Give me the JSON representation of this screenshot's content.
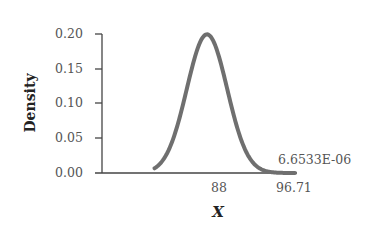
{
  "chart_data": {
    "type": "line",
    "title": "",
    "xlabel": "X",
    "ylabel": "Density",
    "distribution": "normal",
    "mean": 88,
    "sd": 2,
    "ylim": [
      0,
      0.2
    ],
    "yticks": [
      "0.00",
      "0.05",
      "0.10",
      "0.15",
      "0.20"
    ],
    "xticks": [
      "88",
      "96.71"
    ],
    "annotations": [
      {
        "text": "6.6533E-06",
        "x": 96.71,
        "y": 6.6533e-06
      }
    ],
    "series": [
      {
        "name": "density",
        "color": "#6f6f6f",
        "x": [
          82,
          83,
          84,
          85,
          86,
          87,
          88,
          89,
          90,
          91,
          92,
          93,
          94,
          95,
          96,
          96.71
        ],
        "y": [
          0.0022,
          0.0088,
          0.027,
          0.0648,
          0.121,
          0.176,
          0.1995,
          0.176,
          0.121,
          0.0648,
          0.027,
          0.0088,
          0.0022,
          0.0004,
          7e-05,
          6.7e-06
        ]
      }
    ],
    "grid": false,
    "legend": null
  },
  "labels": {
    "y_axis_title": "Density",
    "x_axis_title": "X",
    "y_ticks": [
      "0.20",
      "0.15",
      "0.10",
      "0.05",
      "0.00"
    ],
    "x_tick_mean": "88",
    "x_tick_value": "96.71",
    "annotation": "6.6533E-06"
  }
}
